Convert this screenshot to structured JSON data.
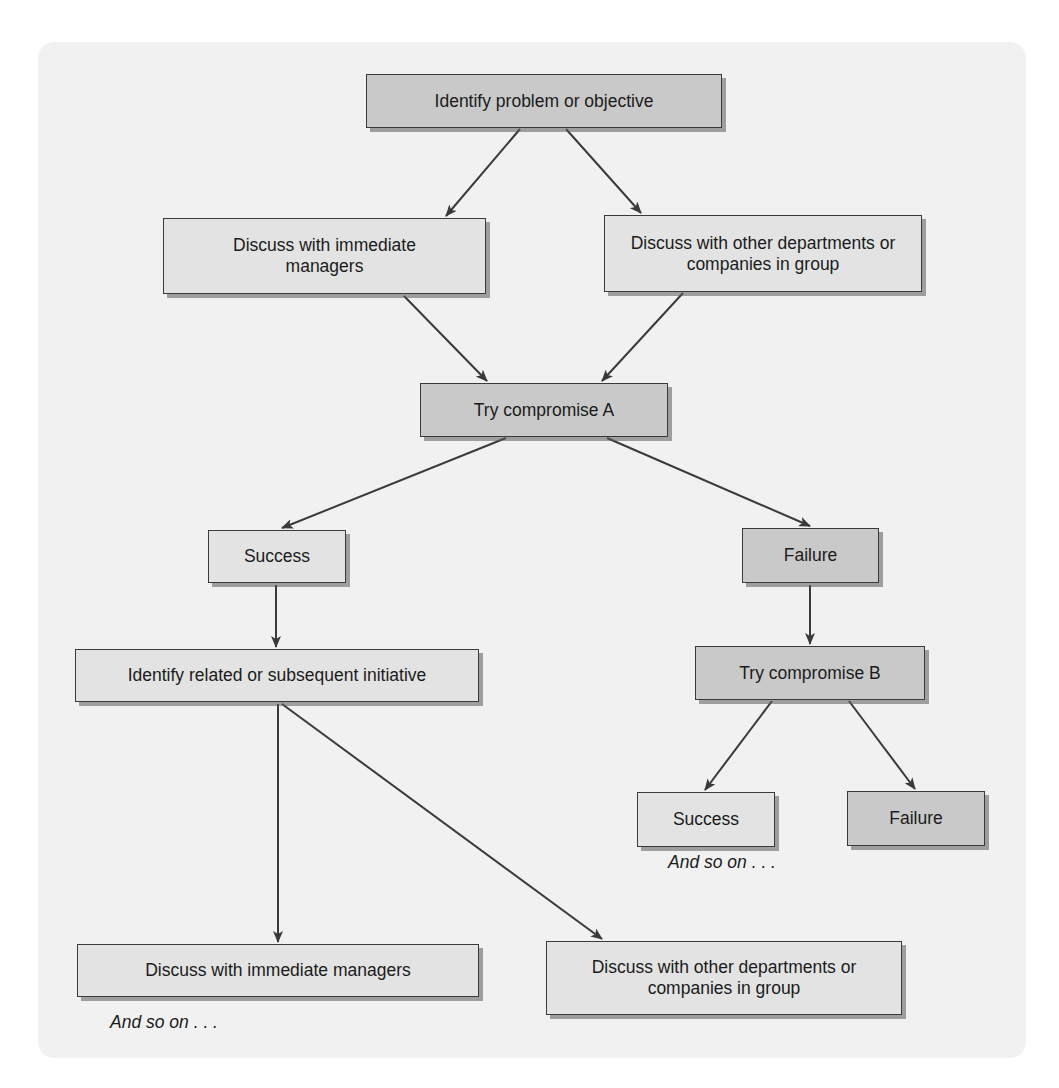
{
  "diagram": {
    "type": "flowchart",
    "colors": {
      "panel_bg": "#f1f1f1",
      "box_light": "#e3e3e3",
      "box_dark": "#c9c9c9",
      "stroke": "#3a3a3a"
    },
    "nodes": {
      "identify_problem": "Identify problem or objective",
      "discuss_managers": "Discuss with immediate managers",
      "discuss_other": "Discuss with other departments or companies in group",
      "try_a": "Try compromise A",
      "success_a": "Success",
      "failure_a": "Failure",
      "identify_related": "Identify related or subsequent initiative",
      "try_b": "Try compromise B",
      "success_b": "Success",
      "failure_b": "Failure",
      "discuss_managers_2": "Discuss with immediate managers",
      "discuss_other_2": "Discuss with other departments or companies in group"
    },
    "notes": {
      "and_so_on_right": "And so on . . .",
      "and_so_on_left": "And so on . . ."
    },
    "edges": [
      [
        "identify_problem",
        "discuss_managers"
      ],
      [
        "identify_problem",
        "discuss_other"
      ],
      [
        "discuss_managers",
        "try_a"
      ],
      [
        "discuss_other",
        "try_a"
      ],
      [
        "try_a",
        "success_a"
      ],
      [
        "try_a",
        "failure_a"
      ],
      [
        "success_a",
        "identify_related"
      ],
      [
        "failure_a",
        "try_b"
      ],
      [
        "try_b",
        "success_b"
      ],
      [
        "try_b",
        "failure_b"
      ],
      [
        "identify_related",
        "discuss_managers_2"
      ],
      [
        "identify_related",
        "discuss_other_2"
      ]
    ]
  }
}
